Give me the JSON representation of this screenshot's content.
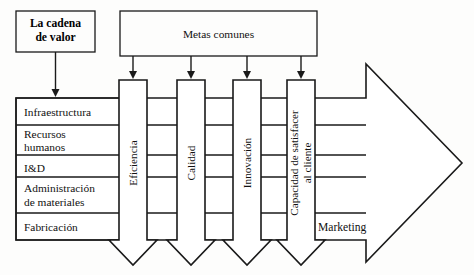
{
  "diagram": {
    "title_box": {
      "line1": "La cadena",
      "line2": "de valor"
    },
    "goals_box": {
      "label": "Metas comunes"
    },
    "value_chain_rows": [
      {
        "label": "Infraestructura",
        "line2": ""
      },
      {
        "label": "Recursos",
        "line2": "humanos"
      },
      {
        "label": "I&D",
        "line2": ""
      },
      {
        "label": "Administración",
        "line2": "de materiales"
      },
      {
        "label": "Fabricación",
        "line2": ""
      }
    ],
    "goal_arrows": [
      {
        "label": "Eficiencia",
        "line2": ""
      },
      {
        "label": "Calidad",
        "line2": ""
      },
      {
        "label": "Innovación",
        "line2": ""
      },
      {
        "label": "Capacidad de satisfacer",
        "line2": "al cliente"
      }
    ],
    "output_arrow": {
      "label": "Marketing"
    },
    "colors": {
      "stroke": "#1a1a1a",
      "fill": "#ffffff",
      "background": "#fdfdfc"
    }
  }
}
